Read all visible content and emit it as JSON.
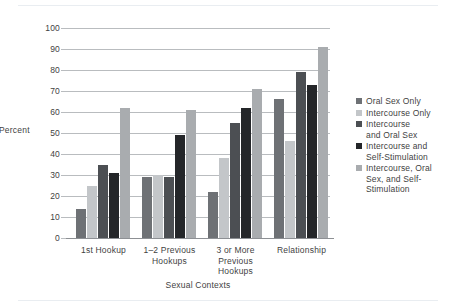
{
  "chart_data": {
    "type": "bar",
    "title": "",
    "xlabel": "Sexual Contexts",
    "ylabel": "Percent",
    "ylim": [
      0,
      100
    ],
    "ytick_step": 10,
    "grid": true,
    "legend_position": "right",
    "categories": [
      "1st Hookup",
      "1–2 Previous Hookups",
      "3 or More Previous Hookups",
      "Relationship"
    ],
    "category_lines": [
      [
        "1st Hookup"
      ],
      [
        "1–2 Previous",
        "Hookups"
      ],
      [
        "3 or More",
        "Previous",
        "Hookups"
      ],
      [
        "Relationship"
      ]
    ],
    "yticks": [
      "0",
      "10",
      "20",
      "30",
      "40",
      "50",
      "60",
      "70",
      "80",
      "90",
      "100"
    ],
    "series": [
      {
        "name": "Oral Sex Only",
        "color": "#6e7175",
        "values": [
          14,
          29,
          22,
          66
        ]
      },
      {
        "name": "Intercourse Only",
        "color": "#c3c6c9",
        "values": [
          25,
          30,
          38,
          46
        ]
      },
      {
        "name": "Intercourse and Oral Sex",
        "color": "#4c4f53",
        "values": [
          35,
          29,
          55,
          79
        ]
      },
      {
        "name": "Intercourse and Self-Stimulation",
        "color": "#242629",
        "values": [
          31,
          49,
          62,
          73
        ]
      },
      {
        "name": "Intercourse, Oral Sex, and Self-Stimulation",
        "color": "#a9acaf",
        "values": [
          62,
          61,
          71,
          91
        ]
      }
    ],
    "legend_entries": [
      {
        "label_lines": [
          "Oral Sex Only"
        ]
      },
      {
        "label_lines": [
          "Intercourse Only"
        ]
      },
      {
        "label_lines": [
          "Intercourse",
          "and Oral Sex"
        ]
      },
      {
        "label_lines": [
          "Intercourse and",
          "Self-Stimulation"
        ]
      },
      {
        "label_lines": [
          "Intercourse, Oral",
          "Sex, and Self-",
          "Stimulation"
        ]
      }
    ]
  }
}
